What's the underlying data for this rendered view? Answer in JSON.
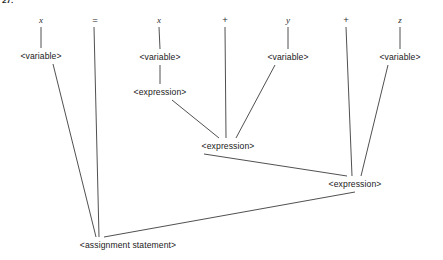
{
  "figure": {
    "tag": "27."
  },
  "canvas": {
    "width": 443,
    "height": 260,
    "background": "#ffffff",
    "line_color": "#3c3c3c",
    "text_color": "#1a1a1a"
  },
  "tree": {
    "title": "parse tree for assignment statement",
    "terminals": [
      {
        "id": "t-x1",
        "label": "x",
        "x": 41,
        "y": 20,
        "kind": "identifier"
      },
      {
        "id": "t-eq",
        "label": "=",
        "x": 95,
        "y": 20,
        "kind": "operator"
      },
      {
        "id": "t-x2",
        "label": "x",
        "x": 159,
        "y": 20,
        "kind": "identifier"
      },
      {
        "id": "t-p1",
        "label": "+",
        "x": 225,
        "y": 20,
        "kind": "operator"
      },
      {
        "id": "t-y",
        "label": "y",
        "x": 288,
        "y": 20,
        "kind": "identifier"
      },
      {
        "id": "t-p2",
        "label": "+",
        "x": 346,
        "y": 20,
        "kind": "operator"
      },
      {
        "id": "t-z",
        "label": "z",
        "x": 400,
        "y": 20,
        "kind": "identifier"
      }
    ],
    "nonterminals": [
      {
        "id": "n-var-x1",
        "label": "<variable>",
        "x": 41,
        "y": 56
      },
      {
        "id": "n-var-x2",
        "label": "<variable>",
        "x": 160,
        "y": 57
      },
      {
        "id": "n-expr-x",
        "label": "<expression>",
        "x": 160,
        "y": 92
      },
      {
        "id": "n-var-y",
        "label": "<variable>",
        "x": 288,
        "y": 57
      },
      {
        "id": "n-var-z",
        "label": "<variable>",
        "x": 400,
        "y": 57
      },
      {
        "id": "n-expr-mid",
        "label": "<expression>",
        "x": 228,
        "y": 146
      },
      {
        "id": "n-expr-low",
        "label": "<expression>",
        "x": 355,
        "y": 184
      },
      {
        "id": "n-assign",
        "label": "<assignment statement>",
        "x": 128,
        "y": 245
      }
    ],
    "edges": [
      {
        "id": "e-x1-var",
        "from": "t-x1",
        "to": "n-var-x1",
        "x1": 41,
        "y1": 27,
        "x2": 41,
        "y2": 48
      },
      {
        "id": "e-eq-assign",
        "from": "t-eq",
        "to": "n-assign",
        "x1": 94,
        "y1": 27,
        "x2": 99,
        "y2": 237
      },
      {
        "id": "e-x2-var",
        "from": "t-x2",
        "to": "n-var-x2",
        "x1": 159,
        "y1": 27,
        "x2": 160,
        "y2": 49
      },
      {
        "id": "e-var-expr-x",
        "from": "n-var-x2",
        "to": "n-expr-x",
        "x1": 160,
        "y1": 65,
        "x2": 160,
        "y2": 84
      },
      {
        "id": "e-p1-exprmid",
        "from": "t-p1",
        "to": "n-expr-mid",
        "x1": 225,
        "y1": 27,
        "x2": 226,
        "y2": 138
      },
      {
        "id": "e-y-var",
        "from": "t-y",
        "to": "n-var-y",
        "x1": 288,
        "y1": 27,
        "x2": 288,
        "y2": 49
      },
      {
        "id": "e-p2-exprlow",
        "from": "t-p2",
        "to": "n-expr-low",
        "x1": 346,
        "y1": 27,
        "x2": 352,
        "y2": 176
      },
      {
        "id": "e-z-var",
        "from": "t-z",
        "to": "n-var-z",
        "x1": 400,
        "y1": 27,
        "x2": 400,
        "y2": 49
      },
      {
        "id": "e-exprx-mid",
        "from": "n-expr-x",
        "to": "n-expr-mid",
        "x1": 172,
        "y1": 100,
        "x2": 219,
        "y2": 138
      },
      {
        "id": "e-vary-mid",
        "from": "n-var-y",
        "to": "n-expr-mid",
        "x1": 275,
        "y1": 65,
        "x2": 236,
        "y2": 138
      },
      {
        "id": "e-exprmid-low",
        "from": "n-expr-mid",
        "to": "n-expr-low",
        "x1": 204,
        "y1": 154,
        "x2": 347,
        "y2": 176
      },
      {
        "id": "e-varz-low",
        "from": "n-var-z",
        "to": "n-expr-low",
        "x1": 388,
        "y1": 65,
        "x2": 361,
        "y2": 176
      },
      {
        "id": "e-varx1-assign",
        "from": "n-var-x1",
        "to": "n-assign",
        "x1": 53,
        "y1": 64,
        "x2": 96,
        "y2": 237
      },
      {
        "id": "e-exprlow-assign",
        "from": "n-expr-low",
        "to": "n-assign",
        "x1": 355,
        "y1": 192,
        "x2": 104,
        "y2": 237
      }
    ]
  }
}
